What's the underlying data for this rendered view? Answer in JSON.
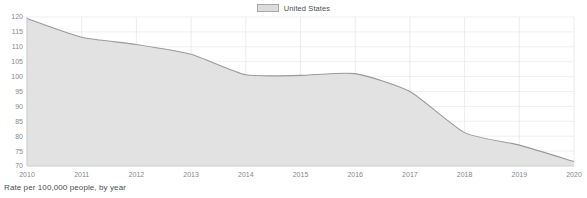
{
  "chart_data": {
    "type": "area",
    "title": "",
    "subtitle": "",
    "xlabel": "",
    "ylabel": "",
    "footnote": "Rate per 100,000 people, by year",
    "legend": {
      "position": "top-center",
      "entries": [
        {
          "name": "United States",
          "color": "#dcdcdc",
          "border": "#a8a8a8"
        }
      ]
    },
    "grid": true,
    "xlim": [
      2010,
      2020
    ],
    "ylim": [
      70,
      120
    ],
    "x": [
      2010,
      2011,
      2012,
      2013,
      2014,
      2015,
      2016,
      2017,
      2018,
      2019,
      2020
    ],
    "xtick_labels": [
      "2010",
      "2011",
      "2012",
      "2013",
      "2014",
      "2015",
      "2016",
      "2017",
      "2018",
      "2019",
      "2020"
    ],
    "yticks": [
      70,
      75,
      80,
      85,
      90,
      95,
      100,
      105,
      110,
      115,
      120
    ],
    "ytick_labels": [
      "70",
      "75",
      "80",
      "85",
      "90",
      "95",
      "100",
      "105",
      "110",
      "115",
      "120"
    ],
    "series": [
      {
        "name": "United States",
        "values": [
          119.5,
          113.2,
          110.8,
          107.5,
          100.6,
          100.4,
          101.0,
          95.0,
          81.2,
          77.0,
          71.5
        ]
      }
    ]
  }
}
